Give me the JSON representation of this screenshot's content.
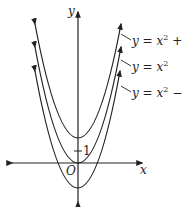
{
  "figure": {
    "type": "graph-of-vertical-translations",
    "axes": {
      "x_label": "x",
      "y_label": "y",
      "origin_label": "O",
      "tick_label": "1"
    },
    "curves": [
      {
        "name": "y = x^2 + 2",
        "label_prefix": "y = x",
        "exponent": "2",
        "label_suffix": " + 2",
        "vertex_y": 2
      },
      {
        "name": "y = x^2",
        "label_prefix": "y = x",
        "exponent": "2",
        "label_suffix": "",
        "vertex_y": 0
      },
      {
        "name": "y = x^2 - 2",
        "label_prefix": "y = x",
        "exponent": "2",
        "label_suffix": " − 2",
        "vertex_y": -2
      }
    ],
    "colors": {
      "stroke": "#222222",
      "background": "#ffffff"
    }
  }
}
